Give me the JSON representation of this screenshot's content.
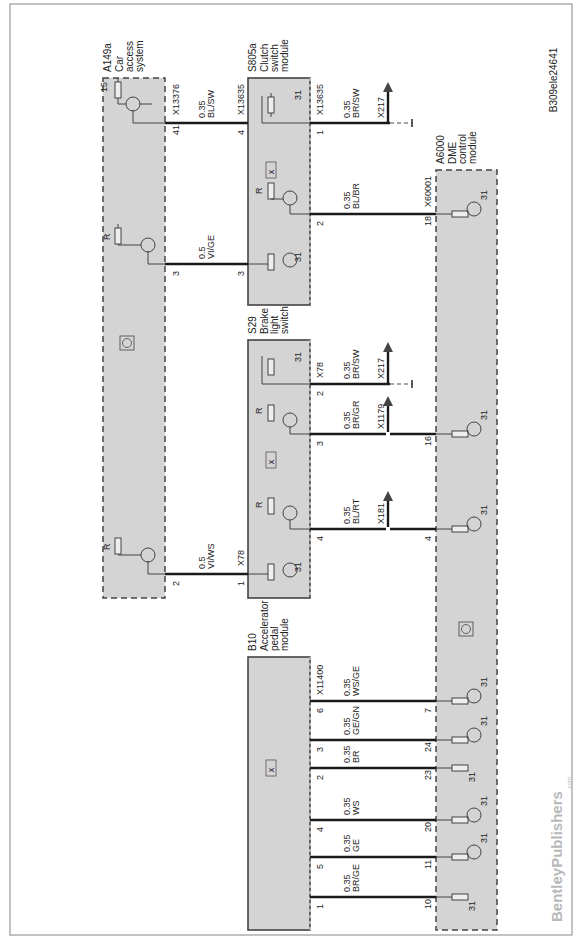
{
  "diagram_id": "B309ele24641",
  "watermark": {
    "brand": "BentleyPublishers",
    "suffix": ".com"
  },
  "modules": {
    "a149a": {
      "code": "A149a",
      "name_lines": [
        "Car",
        "access",
        "system"
      ],
      "connector": "X13376"
    },
    "s805a": {
      "code": "S805a",
      "name_lines": [
        "Clutch",
        "switch",
        "module"
      ],
      "connector": "X13635"
    },
    "s29": {
      "code": "S29",
      "name_lines": [
        "Brake",
        "light",
        "switch"
      ],
      "connector": "X78"
    },
    "b10": {
      "code": "B10",
      "name_lines": [
        "Accelerator",
        "pedal",
        "module"
      ],
      "connector": "X11400"
    },
    "a6000": {
      "code": "A6000",
      "name_lines": [
        "DME",
        "control",
        "module"
      ],
      "connector": "X60001"
    }
  },
  "wires": [
    {
      "from_pin": "41",
      "to_pin": "4",
      "size": "0.35",
      "color": "BL/SW",
      "from": "A149a",
      "to": "S805a",
      "from_connector": "X13376",
      "to_connector": "X13635"
    },
    {
      "from_pin": "3",
      "to_pin": "3",
      "size": "0.5",
      "color": "VI/GE",
      "from": "A149a",
      "to": "S805a"
    },
    {
      "from_pin": "2",
      "to_pin": "1",
      "size": "0.5",
      "color": "VI/WS",
      "from": "A149a",
      "to": "S29",
      "to_connector": "X78"
    },
    {
      "from_pin": "1",
      "to_pin": "",
      "size": "0.35",
      "color": "BR/SW",
      "from": "S805a",
      "to": "X217",
      "from_connector": "X13635"
    },
    {
      "from_pin": "2",
      "to_pin": "18",
      "size": "0.35",
      "color": "BL/BR",
      "from": "S805a",
      "to": "A6000",
      "to_connector": "X60001"
    },
    {
      "from_pin": "2",
      "to_pin": "",
      "size": "0.35",
      "color": "BR/SW",
      "from": "S29",
      "to": "X217",
      "from_connector": "X78"
    },
    {
      "from_pin": "3",
      "to_pin": "16",
      "size": "0.35",
      "color": "BR/GR",
      "from": "S29",
      "to": "A6000",
      "splice": "X1179"
    },
    {
      "from_pin": "4",
      "to_pin": "4",
      "size": "0.35",
      "color": "BL/RT",
      "from": "S29",
      "to": "A6000",
      "splice": "X181"
    },
    {
      "from_pin": "6",
      "to_pin": "7",
      "size": "0.35",
      "color": "WS/GE",
      "from": "B10",
      "to": "A6000",
      "from_connector": "X11400"
    },
    {
      "from_pin": "3",
      "to_pin": "24",
      "size": "0.35",
      "color": "GE/GN",
      "from": "B10",
      "to": "A6000"
    },
    {
      "from_pin": "2",
      "to_pin": "23",
      "size": "0.35",
      "color": "BR",
      "from": "B10",
      "to": "A6000"
    },
    {
      "from_pin": "4",
      "to_pin": "20",
      "size": "0.35",
      "color": "WS",
      "from": "B10",
      "to": "A6000"
    },
    {
      "from_pin": "5",
      "to_pin": "11",
      "size": "0.35",
      "color": "GE",
      "from": "B10",
      "to": "A6000"
    },
    {
      "from_pin": "1",
      "to_pin": "10",
      "size": "0.35",
      "color": "BR/GE",
      "from": "B10",
      "to": "A6000"
    }
  ],
  "labels": {
    "r": "R",
    "ground": "31",
    "supply15": "15",
    "splice_x217": "X217",
    "splice_x1179": "X1179",
    "splice_x181": "X181"
  }
}
